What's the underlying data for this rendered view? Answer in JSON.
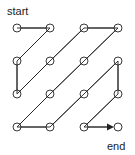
{
  "diagram": {
    "type": "zigzag-scan",
    "grid": {
      "rows": 4,
      "cols": 4
    },
    "labels": {
      "start": "start",
      "end": "end"
    },
    "path": [
      [
        0,
        0
      ],
      [
        0,
        1
      ],
      [
        1,
        0
      ],
      [
        2,
        0
      ],
      [
        1,
        1
      ],
      [
        0,
        2
      ],
      [
        0,
        3
      ],
      [
        1,
        2
      ],
      [
        2,
        1
      ],
      [
        3,
        0
      ],
      [
        3,
        1
      ],
      [
        2,
        2
      ],
      [
        1,
        3
      ],
      [
        2,
        3
      ],
      [
        3,
        2
      ],
      [
        3,
        3
      ]
    ],
    "colors": {
      "line": "#222222",
      "node_fill": "#ffffff"
    }
  }
}
